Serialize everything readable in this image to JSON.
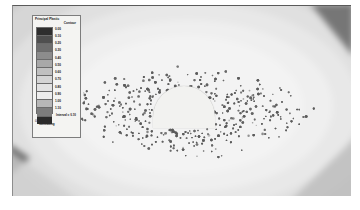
{
  "legend": {
    "title_line1": "Principal Plastic",
    "title_line2": "Contour",
    "note": "Interval = 0.10",
    "footer_mark": "0",
    "footer_line1": "Itasca",
    "footer_line2": "Consulting",
    "ticks": [
      "0.00",
      "0.10",
      "0.20",
      "0.30",
      "0.40",
      "0.50",
      "0.60",
      "0.70",
      "0.80",
      "0.90",
      "1.00",
      "1.10"
    ],
    "swatch_colors": [
      "#2e2e2e",
      "#4f4f4f",
      "#6e6e6e",
      "#8c8c8c",
      "#a8a8a8",
      "#c0c0c0",
      "#d4d4d4",
      "#e2e2e2",
      "#ededed",
      "#b7b7b7",
      "#7d7d7d",
      "#2b2b2b"
    ]
  },
  "chart_data": {
    "type": "heatmap",
    "title": "Principal Plastic Contour",
    "xlabel": "",
    "ylabel": "",
    "legend_position": "left",
    "grid": false,
    "colorbar_levels": [
      0.0,
      0.1,
      0.2,
      0.3,
      0.4,
      0.5,
      0.6,
      0.7,
      0.8,
      0.9,
      1.0,
      1.1
    ],
    "colorbar_interval": 0.1,
    "contour_bands": [
      {
        "name": "outermost",
        "value": 0.1,
        "color": "#c9c9c9"
      },
      {
        "name": "band-4",
        "value": 0.3,
        "color": "#d6d6d6"
      },
      {
        "name": "band-3",
        "value": 0.5,
        "color": "#e0e0e0"
      },
      {
        "name": "band-2",
        "value": 0.7,
        "color": "#e8e8e8"
      },
      {
        "name": "band-1",
        "value": 0.9,
        "color": "#efefef"
      },
      {
        "name": "core",
        "value": 1.1,
        "color": "#f3f3f3"
      }
    ],
    "tunnel": {
      "shape": "horseshoe",
      "center_x": 171,
      "center_y": 101,
      "width": 62,
      "height": 42,
      "fill": "#f2f2f0"
    },
    "plasticity_markers": {
      "count": 1500,
      "symbol": "dot",
      "color": "#5b5b5b",
      "description": "Yielded-element markers forming the plastic zone around the opening"
    }
  },
  "field": {
    "background": "#e9e9e9",
    "wedge_top_right": "#6e6e6e",
    "wedge_left": "#4f4f4f"
  }
}
